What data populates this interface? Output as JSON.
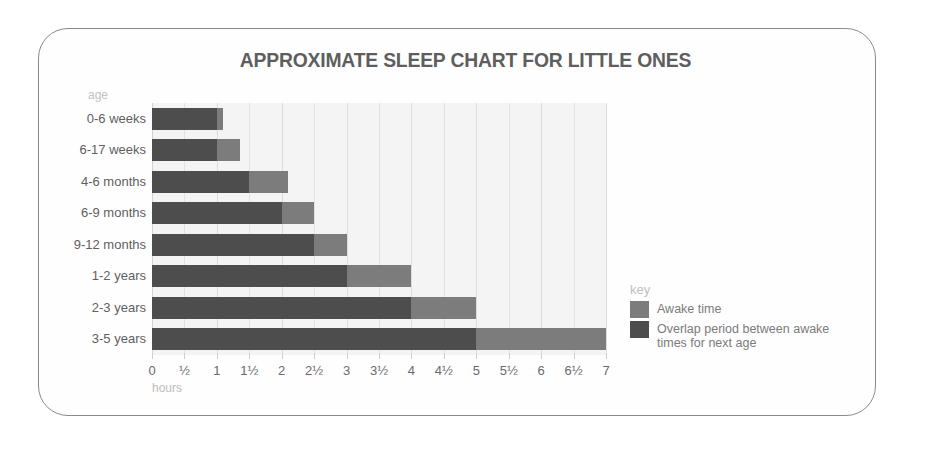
{
  "frame": {
    "border_color": "#8a8a8a"
  },
  "chart_data": {
    "type": "bar",
    "orientation": "horizontal",
    "stacked": true,
    "title": "APPROXIMATE SLEEP CHART FOR LITTLE ONES",
    "xlabel": "hours",
    "ylabel": "age",
    "xlim": [
      0,
      7
    ],
    "grid": true,
    "legend_position": "right",
    "categories": [
      "0-6 weeks",
      "6-17 weeks",
      "4-6 months",
      "6-9 months",
      "9-12 months",
      "1-2 years",
      "2-3 years",
      "3-5 years"
    ],
    "xticks": [
      0,
      0.5,
      1,
      1.5,
      2,
      2.5,
      3,
      3.5,
      4,
      4.5,
      5,
      5.5,
      6,
      6.5,
      7
    ],
    "xtick_labels": [
      "0",
      "½",
      "1",
      "1½",
      "2",
      "2½",
      "3",
      "3½",
      "4",
      "4½",
      "5",
      "5½",
      "6",
      "6½",
      "7"
    ],
    "series": [
      {
        "name": "Awake time",
        "color": "#7c7c7c",
        "values": [
          1.0,
          1.0,
          1.5,
          2.0,
          2.5,
          3.0,
          4.0,
          5.0
        ]
      },
      {
        "name": "Overlap period between awake times for next age",
        "color": "#4d4d4d",
        "values": [
          1.1,
          1.35,
          2.1,
          2.5,
          3.0,
          4.0,
          5.0,
          7.0
        ]
      }
    ],
    "bars": [
      {
        "age": "0-6 weeks",
        "awake_end": 1.0,
        "overlap_end": 1.1
      },
      {
        "age": "6-17 weeks",
        "awake_end": 1.0,
        "overlap_end": 1.35
      },
      {
        "age": "4-6 months",
        "awake_end": 1.5,
        "overlap_end": 2.1
      },
      {
        "age": "6-9 months",
        "awake_end": 2.0,
        "overlap_end": 2.5
      },
      {
        "age": "9-12 months",
        "awake_end": 2.5,
        "overlap_end": 3.0
      },
      {
        "age": "1-2 years",
        "awake_end": 3.0,
        "overlap_end": 4.0
      },
      {
        "age": "2-3 years",
        "awake_end": 4.0,
        "overlap_end": 5.0
      },
      {
        "age": "3-5 years",
        "awake_end": 5.0,
        "overlap_end": 7.0
      }
    ]
  },
  "axis_captions": {
    "age": "age",
    "hours": "hours"
  },
  "legend": {
    "title": "key",
    "items": [
      {
        "label": "Awake time",
        "color": "#7c7c7c"
      },
      {
        "label": "Overlap period between awake times for next age",
        "color": "#4d4d4d"
      }
    ]
  }
}
